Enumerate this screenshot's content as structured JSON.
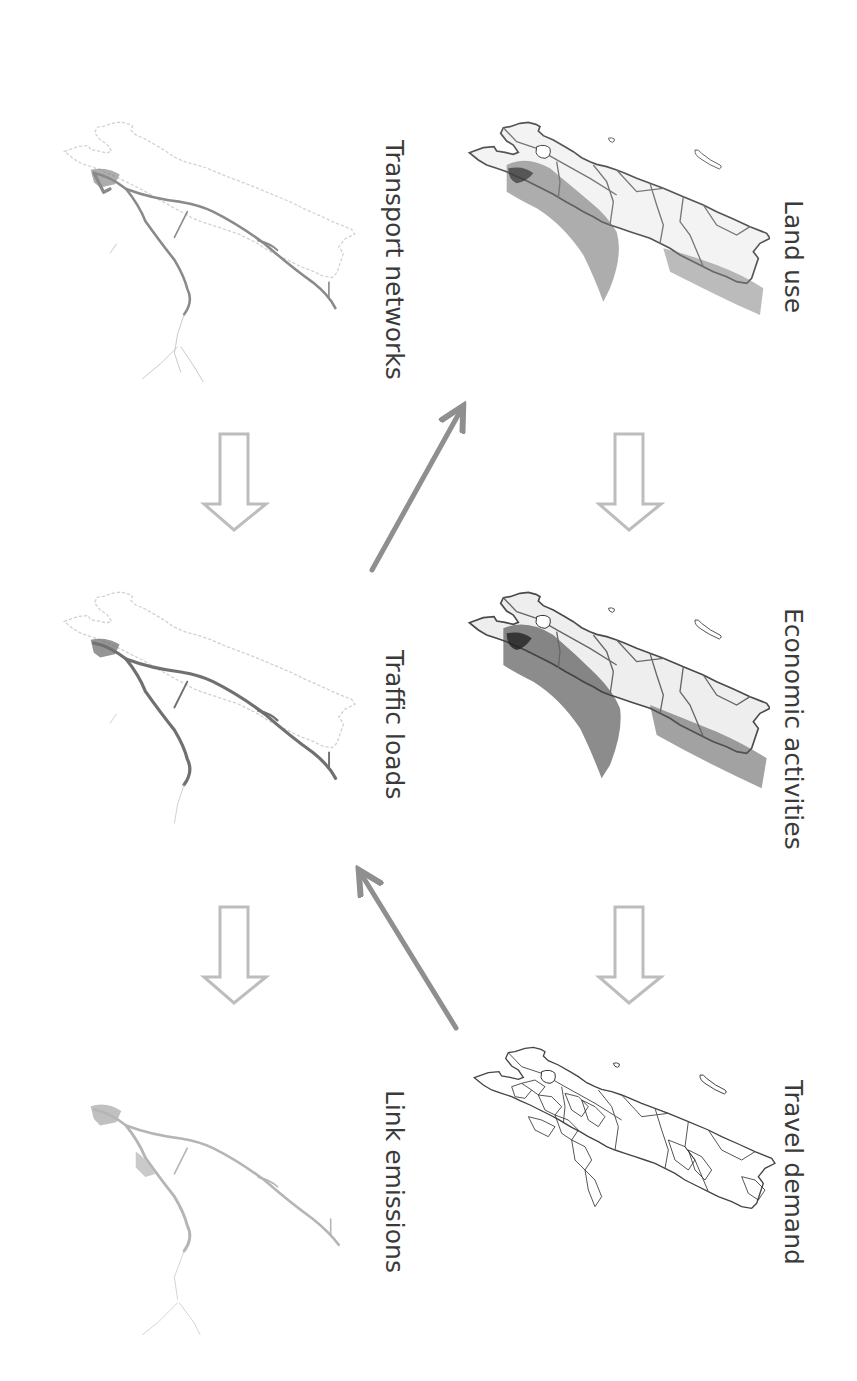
{
  "diagram": {
    "orientation": "rotated-90-clockwise",
    "colors": {
      "background": "#ffffff",
      "label_text": "#3a3a3a",
      "flow_arrow_outline": "#bdbdbd",
      "feedback_arrow": "#8f8f8f",
      "map_dark": "#444444",
      "map_outline": "#666666",
      "map_light": "#b8b8b8"
    },
    "nodes": [
      {
        "id": "land_use",
        "label": "Land use",
        "column": "right",
        "position": 1
      },
      {
        "id": "economic_activities",
        "label": "Economic activities",
        "column": "right",
        "position": 2
      },
      {
        "id": "travel_demand",
        "label": "Travel demand",
        "column": "right",
        "position": 3
      },
      {
        "id": "transport_networks",
        "label": "Transport networks",
        "column": "left",
        "position": 1
      },
      {
        "id": "traffic_loads",
        "label": "Traffic loads",
        "column": "left",
        "position": 2
      },
      {
        "id": "link_emissions",
        "label": "Link emissions",
        "column": "left",
        "position": 3
      }
    ],
    "edges": [
      {
        "from": "land_use",
        "to": "economic_activities",
        "style": "hollow-block-arrow"
      },
      {
        "from": "economic_activities",
        "to": "travel_demand",
        "style": "hollow-block-arrow"
      },
      {
        "from": "transport_networks",
        "to": "traffic_loads",
        "style": "hollow-block-arrow"
      },
      {
        "from": "traffic_loads",
        "to": "link_emissions",
        "style": "hollow-block-arrow"
      },
      {
        "from": "travel_demand",
        "to": "traffic_loads",
        "style": "solid-line-arrow"
      },
      {
        "from": "traffic_loads",
        "to": "land_use",
        "style": "solid-line-arrow"
      }
    ]
  }
}
